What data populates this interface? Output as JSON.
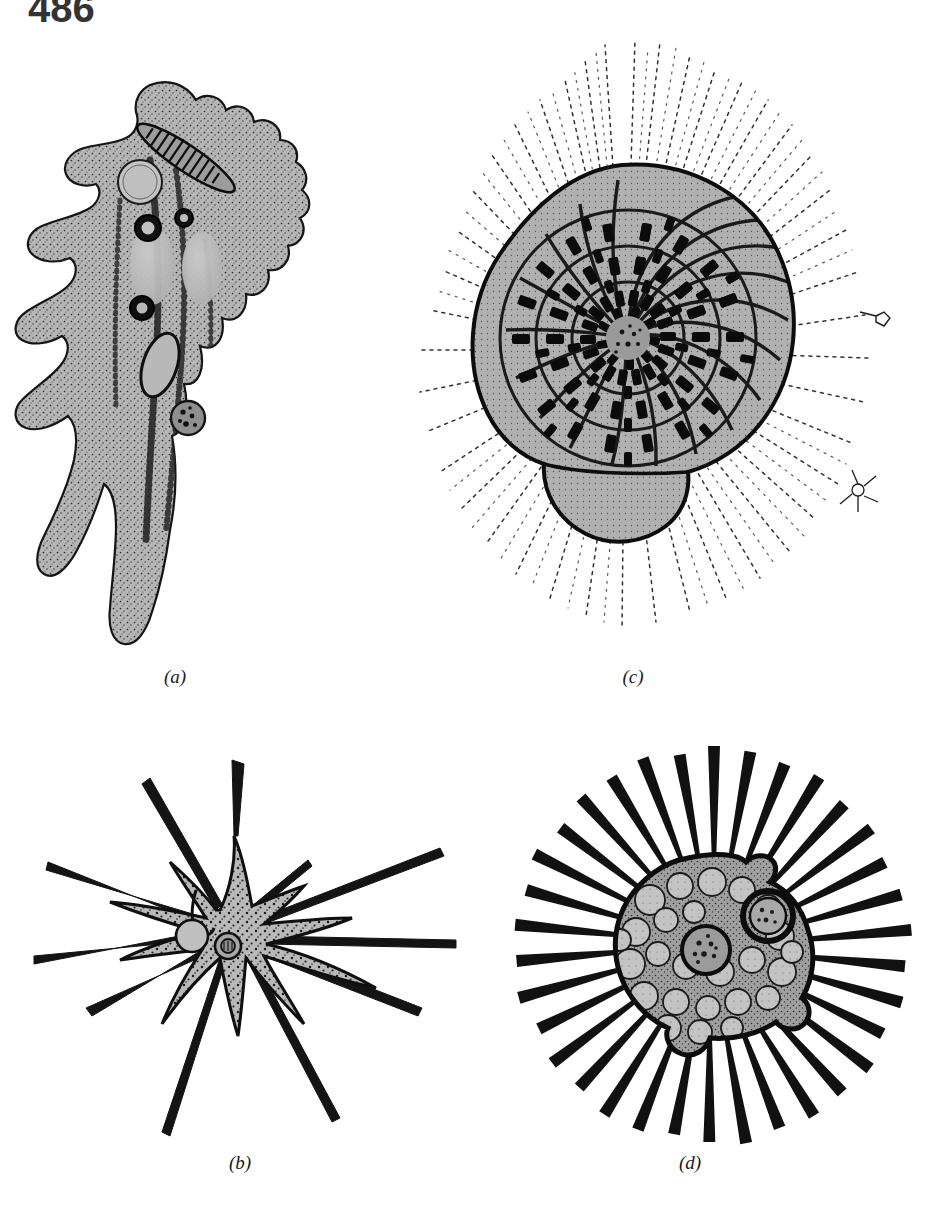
{
  "page": {
    "number": "486",
    "background_color": "#ffffff",
    "ink_color": "#1a1a1a",
    "cytoplasm_fill": "#b3b3b3",
    "width": 929,
    "height": 1205
  },
  "figure": {
    "type": "scientific-illustration-plate",
    "panel_count": 4,
    "panels": [
      {
        "id": "a",
        "caption": "(a)",
        "subject": "amoeba-with-lobopodia",
        "description": "Amoeba with broad lobed pseudopodia, stippled granular cytoplasm, contractile vacuole, food vacuoles and an ingested diatom",
        "caption_x": 175,
        "caption_y": 676,
        "features": [
          "lobopodia",
          "contractile-vacuole",
          "food-vacuole",
          "ingested-diatom",
          "nucleus",
          "granular-cytoplasm"
        ]
      },
      {
        "id": "b",
        "caption": "(b)",
        "subject": "axopodial-amoeba",
        "description": "Star-shaped cell with ten long tapering axopodia, central nucleus and contractile vacuole",
        "caption_x": 240,
        "caption_y": 1162,
        "axopodia_count": 10,
        "features": [
          "axopodia",
          "nucleus",
          "contractile-vacuole",
          "granular-cytoplasm"
        ]
      },
      {
        "id": "c",
        "caption": "(c)",
        "subject": "foraminiferan",
        "description": "Foraminiferan with planispiral multi-chambered calcareous test and a dense halo of fine branching reticulopodia",
        "caption_x": 633,
        "caption_y": 676,
        "chamber_whorls": 3,
        "features": [
          "spiral-test",
          "chambers",
          "pores",
          "reticulopodia",
          "final-chamber"
        ]
      },
      {
        "id": "d",
        "caption": "(d)",
        "subject": "heliozoan",
        "description": "Heliozoan with vacuolated spherical body and many straight radiating axopodia",
        "caption_x": 690,
        "caption_y": 1162,
        "axopodia_count": 34,
        "features": [
          "axopodia",
          "vacuolated-cytoplasm",
          "nucleus",
          "food-vacuole"
        ]
      }
    ]
  }
}
